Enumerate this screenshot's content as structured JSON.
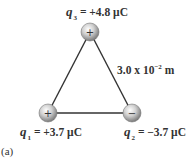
{
  "figure": {
    "panel_label": "(a)",
    "side_length_label": {
      "mantissa": "3.0 x 10",
      "exponent": "−2",
      "unit": " m"
    },
    "charges": [
      {
        "id": "q1",
        "symbol": "q",
        "subscript": "1",
        "value": "= +3.7 μC",
        "sign": "+",
        "position": "bottom-left"
      },
      {
        "id": "q2",
        "symbol": "q",
        "subscript": "2",
        "value": "= −3.7 μC",
        "sign": "−",
        "position": "bottom-right"
      },
      {
        "id": "q3",
        "symbol": "q",
        "subscript": "3",
        "value": "= +4.8 μC",
        "sign": "+",
        "position": "top"
      }
    ],
    "colors": {
      "line": "#333333",
      "sphere_light": "#f4f4f4",
      "sphere_dark": "#7a7a7a",
      "text": "#333333"
    }
  }
}
